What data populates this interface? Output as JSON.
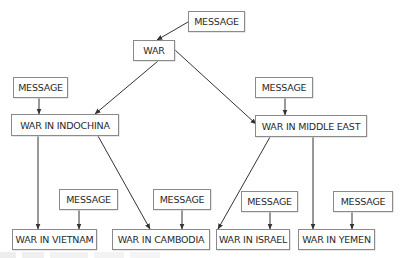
{
  "diagram": {
    "colors": {
      "box_border": "#8a8a8a",
      "text": "#2a2a2a",
      "edge": "#333333",
      "background": "#ffffff"
    },
    "nodes": [
      {
        "id": "msg-top",
        "label": "MESSAGE",
        "x": 188,
        "y": 11,
        "w": 57,
        "h": 21
      },
      {
        "id": "war",
        "label": "WAR",
        "x": 133,
        "y": 40,
        "w": 42,
        "h": 21
      },
      {
        "id": "msg-left",
        "label": "MESSAGE",
        "x": 13,
        "y": 77,
        "w": 55,
        "h": 21
      },
      {
        "id": "indochina",
        "label": "WAR IN INDOCHINA",
        "x": 11,
        "y": 114,
        "w": 108,
        "h": 22
      },
      {
        "id": "msg-right",
        "label": "MESSAGE",
        "x": 255,
        "y": 77,
        "w": 58,
        "h": 21
      },
      {
        "id": "middle-east",
        "label": "WAR IN MIDDLE EAST",
        "x": 255,
        "y": 115,
        "w": 112,
        "h": 22
      },
      {
        "id": "msg-vietnam",
        "label": "MESSAGE",
        "x": 59,
        "y": 189,
        "w": 59,
        "h": 21
      },
      {
        "id": "msg-cambodia",
        "label": "MESSAGE",
        "x": 153,
        "y": 189,
        "w": 58,
        "h": 21
      },
      {
        "id": "msg-israel",
        "label": "MESSAGE",
        "x": 241,
        "y": 191,
        "w": 57,
        "h": 21
      },
      {
        "id": "msg-yemen",
        "label": "MESSAGE",
        "x": 333,
        "y": 191,
        "w": 60,
        "h": 21
      },
      {
        "id": "vietnam",
        "label": "WAR IN VIETNAM",
        "x": 12,
        "y": 229,
        "w": 85,
        "h": 21
      },
      {
        "id": "cambodia",
        "label": "WAR IN CAMBODIA",
        "x": 112,
        "y": 229,
        "w": 98,
        "h": 21
      },
      {
        "id": "israel",
        "label": "WAR IN ISRAEL",
        "x": 216,
        "y": 229,
        "w": 74,
        "h": 21
      },
      {
        "id": "yemen",
        "label": "WAR IN YEMEN",
        "x": 298,
        "y": 229,
        "w": 77,
        "h": 21
      }
    ],
    "edges": [
      {
        "from": "msg-top",
        "to": "war",
        "x1": 188,
        "y1": 22,
        "x2": 157,
        "y2": 40
      },
      {
        "from": "war",
        "to": "indochina",
        "x1": 158,
        "y1": 61,
        "x2": 95,
        "y2": 114
      },
      {
        "from": "war",
        "to": "middle-east",
        "x1": 175,
        "y1": 50,
        "x2": 256,
        "y2": 124
      },
      {
        "from": "msg-left",
        "to": "indochina",
        "x1": 39,
        "y1": 98,
        "x2": 39,
        "y2": 114
      },
      {
        "from": "msg-right",
        "to": "middle-east",
        "x1": 285,
        "y1": 98,
        "x2": 285,
        "y2": 115
      },
      {
        "from": "indochina",
        "to": "vietnam",
        "x1": 38,
        "y1": 136,
        "x2": 38,
        "y2": 229
      },
      {
        "from": "indochina",
        "to": "cambodia",
        "x1": 98,
        "y1": 136,
        "x2": 150,
        "y2": 229
      },
      {
        "from": "middle-east",
        "to": "israel",
        "x1": 270,
        "y1": 137,
        "x2": 218,
        "y2": 229
      },
      {
        "from": "middle-east",
        "to": "yemen",
        "x1": 313,
        "y1": 137,
        "x2": 313,
        "y2": 229
      },
      {
        "from": "msg-vietnam",
        "to": "vietnam",
        "x1": 79,
        "y1": 210,
        "x2": 79,
        "y2": 229
      },
      {
        "from": "msg-cambodia",
        "to": "cambodia",
        "x1": 182,
        "y1": 210,
        "x2": 182,
        "y2": 229
      },
      {
        "from": "msg-israel",
        "to": "israel",
        "x1": 270,
        "y1": 212,
        "x2": 270,
        "y2": 229
      },
      {
        "from": "msg-yemen",
        "to": "yemen",
        "x1": 352,
        "y1": 212,
        "x2": 352,
        "y2": 229
      }
    ]
  }
}
